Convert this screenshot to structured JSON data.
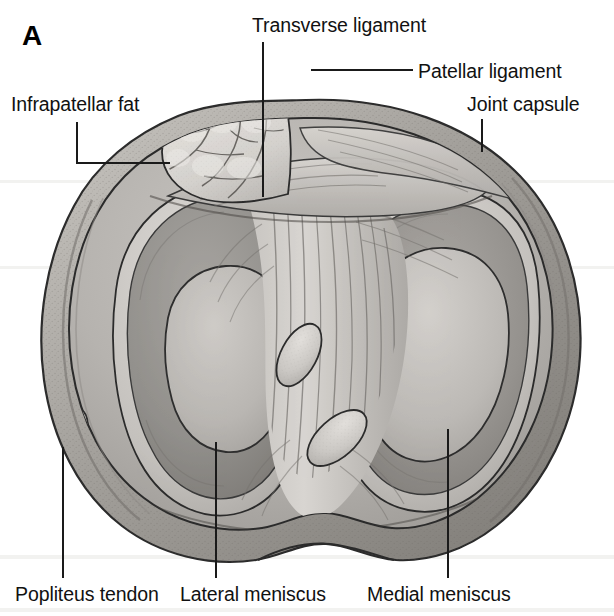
{
  "figure": {
    "panel_letter": "A",
    "background_color": "#ffffff",
    "ink_color": "#111111",
    "width": 614,
    "height": 616
  },
  "labels": [
    {
      "id": "transverse-ligament",
      "text": "Transverse ligament",
      "x": 252,
      "y": 14,
      "align": "left"
    },
    {
      "id": "patellar-ligament",
      "text": "Patellar ligament",
      "x": 418,
      "y": 60,
      "align": "left"
    },
    {
      "id": "infrapatellar-fat",
      "text": "Infrapatellar fat",
      "x": 11,
      "y": 93,
      "align": "left"
    },
    {
      "id": "joint-capsule",
      "text": "Joint capsule",
      "x": 467,
      "y": 93,
      "align": "left"
    },
    {
      "id": "popliteus-tendon",
      "text": "Popliteus tendon",
      "x": 15,
      "y": 583,
      "align": "left"
    },
    {
      "id": "lateral-meniscus",
      "text": "Lateral meniscus",
      "x": 180,
      "y": 583,
      "align": "left"
    },
    {
      "id": "medial-meniscus",
      "text": "Medial meniscus",
      "x": 367,
      "y": 583,
      "align": "left"
    }
  ],
  "leader_lines": [
    {
      "id": "leader-transverse-ligament",
      "type": "vertical",
      "x": 262,
      "y": 42,
      "length": 155
    },
    {
      "id": "leader-patellar-ligament",
      "type": "horizontal",
      "x": 311,
      "y": 69,
      "length": 102
    },
    {
      "id": "leader-infrapatellar-fat-v",
      "type": "vertical",
      "x": 76,
      "y": 122,
      "length": 41
    },
    {
      "id": "leader-infrapatellar-fat-h",
      "type": "horizontal",
      "x": 76,
      "y": 162,
      "length": 94
    },
    {
      "id": "leader-joint-capsule",
      "type": "vertical",
      "x": 481,
      "y": 119,
      "length": 33
    },
    {
      "id": "leader-popliteus-tendon",
      "type": "vertical",
      "x": 62,
      "y": 447,
      "length": 131
    },
    {
      "id": "leader-lateral-meniscus",
      "type": "vertical",
      "x": 215,
      "y": 442,
      "length": 136
    },
    {
      "id": "leader-medial-meniscus",
      "type": "vertical",
      "x": 447,
      "y": 429,
      "length": 149
    }
  ],
  "illustration": {
    "title": "Superior view of the tibial plateau of the right knee",
    "structures": [
      {
        "name": "joint-capsule",
        "description": "outer fibrous rim encircling the plateau"
      },
      {
        "name": "infrapatellar-fat-pad",
        "description": "lobulated fat mass at anterolateral margin"
      },
      {
        "name": "patellar-ligament",
        "description": "dense band across anterior margin"
      },
      {
        "name": "transverse-ligament",
        "description": "band joining anterior horns of the menisci"
      },
      {
        "name": "lateral-meniscus",
        "description": "C-shaped fibrocartilage, left compartment"
      },
      {
        "name": "medial-meniscus",
        "description": "C-shaped fibrocartilage, right compartment"
      },
      {
        "name": "anterior-cruciate-ligament",
        "description": "upper oval cut section in intercondylar area"
      },
      {
        "name": "posterior-cruciate-ligament",
        "description": "lower oval cut section in intercondylar area"
      },
      {
        "name": "popliteus-tendon",
        "description": "elongated oval section at posterolateral corner"
      }
    ],
    "palette": {
      "capsule_rim": "#b8b5b0",
      "capsule_rim_dark": "#6e6b66",
      "plateau_base": "#bdbab6",
      "meniscus_light": "#d2cfcb",
      "articular_dark": "#8f8c88",
      "articular_mid": "#a5a29e",
      "fat_pad": "#d8d5d1",
      "ligament_fiber": "#c6c3bf",
      "outline": "#2b2b2b"
    }
  }
}
